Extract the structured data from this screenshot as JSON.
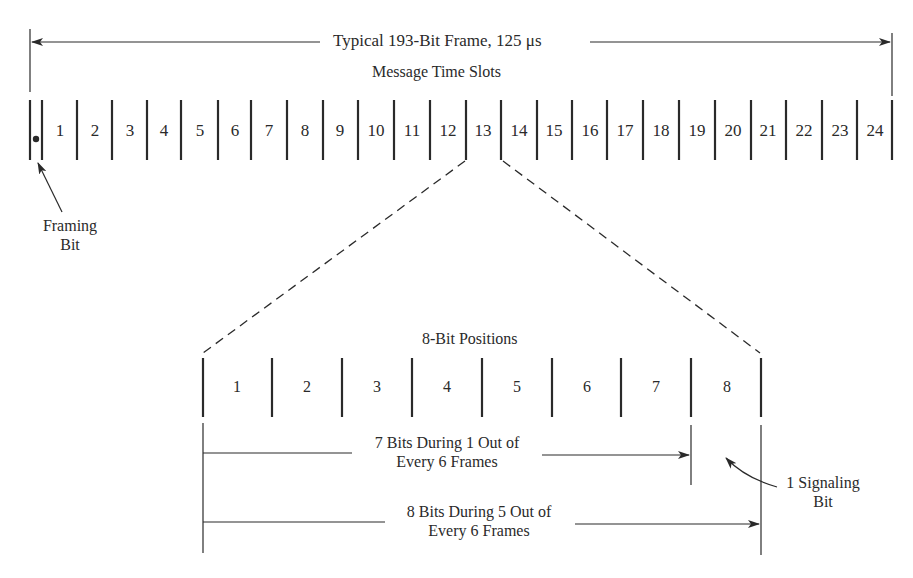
{
  "frame": {
    "title": "Typical 193-Bit Frame, 125 μs",
    "subtitle": "Message Time Slots",
    "slots": [
      "1",
      "2",
      "3",
      "4",
      "5",
      "6",
      "7",
      "8",
      "9",
      "10",
      "11",
      "12",
      "13",
      "14",
      "15",
      "16",
      "17",
      "18",
      "19",
      "20",
      "21",
      "22",
      "23",
      "24"
    ],
    "expanded_slot": "13"
  },
  "framing_bit": {
    "label_line1": "Framing",
    "label_line2": "Bit"
  },
  "bit_positions": {
    "title": "8-Bit Positions",
    "bits": [
      "1",
      "2",
      "3",
      "4",
      "5",
      "6",
      "7",
      "8"
    ]
  },
  "brackets": {
    "seven_bit_line1": "7 Bits During 1 Out of",
    "seven_bit_line2": "Every 6 Frames",
    "eight_bit_line1": "8 Bits During 5 Out of",
    "eight_bit_line2": "Every 6 Frames"
  },
  "signaling_bit": {
    "label_line1": "1 Signaling",
    "label_line2": "Bit"
  },
  "colors": {
    "ink": "#2a2a2a",
    "background": "#ffffff"
  }
}
